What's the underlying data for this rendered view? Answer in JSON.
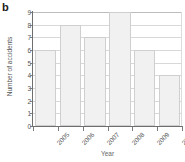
{
  "panel": {
    "label": "b"
  },
  "chart_data": {
    "type": "bar",
    "title": "",
    "xlabel": "Year",
    "ylabel": "Number of accidents",
    "categories": [
      "2005",
      "2006",
      "2007",
      "2008",
      "2009",
      "2010"
    ],
    "values": [
      6,
      8,
      7,
      9,
      6,
      4
    ],
    "ylim": [
      0,
      9
    ],
    "yticks": [
      "0",
      "1",
      "2",
      "3",
      "4",
      "5",
      "6",
      "7",
      "8",
      "9"
    ],
    "grid": "horizontal",
    "legend": "none",
    "colors": {
      "bar_fill": "#f1f1f1",
      "bar_edge": "#cfcfcf",
      "axis": "#6e6e6e",
      "grid": "#d8d8d8",
      "text": "#555555"
    }
  }
}
